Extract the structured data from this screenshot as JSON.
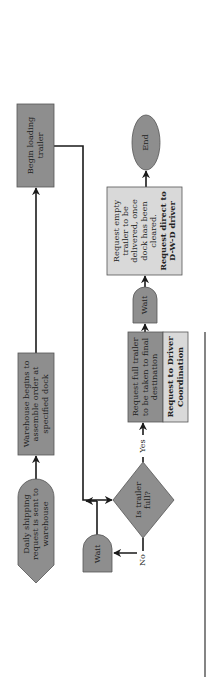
{
  "diagram": {
    "type": "flowchart",
    "orientation": "rotated-90-ccw",
    "colors": {
      "dark_fill": "#8e8e8e",
      "light_fill": "#d9d9d9",
      "stroke": "#555555",
      "connector": "#1a1a1a",
      "text": "#222222"
    },
    "nodes": {
      "daily_request": {
        "label": "Daily shipping request is sent to warehouse",
        "shape": "pentagon-pointer"
      },
      "warehouse_assemble": {
        "label": "Warehouse begins to assemble order at specified dock",
        "shape": "rectangle"
      },
      "begin_loading": {
        "label": "Begin loading trailer",
        "shape": "rectangle"
      },
      "decision": {
        "label": "Is trailer full?",
        "shape": "diamond"
      },
      "wait_left": {
        "label": "Wait",
        "shape": "delay"
      },
      "request_full": {
        "label": "Request full trailer to be taken to final destination",
        "shape": "rectangle"
      },
      "driver_coordination": {
        "label": "Request to Driver Coordination",
        "shape": "rectangle",
        "bold": true
      },
      "wait_right": {
        "label": "Wait",
        "shape": "delay"
      },
      "request_empty": {
        "label": "Request empty trailer to be delivered, once dock has been cleared.",
        "bold_label": "Request direct to D-W-D driver",
        "shape": "rectangle"
      },
      "end": {
        "label": "End",
        "shape": "ellipse"
      }
    },
    "edge_labels": {
      "yes": "Yes",
      "no": "No"
    },
    "edges": [
      {
        "from": "daily_request",
        "to": "warehouse_assemble"
      },
      {
        "from": "warehouse_assemble",
        "to": "begin_loading"
      },
      {
        "from": "begin_loading",
        "to": "decision"
      },
      {
        "from": "decision",
        "to": "wait_left",
        "label": "No"
      },
      {
        "from": "wait_left",
        "to": "decision"
      },
      {
        "from": "decision",
        "to": "request_full",
        "label": "Yes"
      },
      {
        "from": "request_full",
        "to": "wait_right"
      },
      {
        "from": "wait_right",
        "to": "request_empty"
      },
      {
        "from": "request_empty",
        "to": "end"
      }
    ]
  }
}
